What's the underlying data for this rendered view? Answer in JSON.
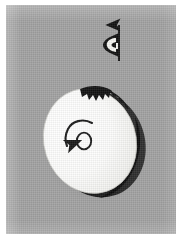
{
  "figure": {
    "title": "Spinning disc with angular velocity and vertical axis arrow",
    "caption": "",
    "plate": {
      "background_color": "#a2a2a2",
      "border_color": "#ffffff",
      "width": 170,
      "height": 229
    }
  },
  "objects": {
    "disc": {
      "name": "disc",
      "label": "",
      "fill_color": "#fbfbfa",
      "rim_color": "#161616",
      "shadow_color": "#6f6f6f",
      "center_x": 86,
      "center_y": 138,
      "radius_x": 47,
      "radius_y": 54,
      "tilt_degrees": -18,
      "notes": "white circular disc seen obliquely, dark thick rim along upper-right and lower-right edge, jagged chipped detail near top-right"
    },
    "rotation_arrow": {
      "name": "angular-velocity-arrow",
      "symbol": "ω",
      "direction": "counterclockwise",
      "color": "#1c1c1c",
      "center_x": 74,
      "center_y": 131
    },
    "axis_arrow": {
      "name": "vertical-axis-arrow",
      "direction": "up",
      "color": "#121212",
      "tip_x": 119,
      "tip_y": 17,
      "tail_x": 119,
      "tail_y": 58
    },
    "hand_glyph": {
      "name": "hand-glyph",
      "label": "",
      "fill_color": "#f4f4f0",
      "outline_color": "#141414",
      "center_x": 110,
      "center_y": 40,
      "notes": "small white hand / flag shape attached at left of the vertical arrow shaft"
    }
  },
  "annotations": {
    "omega_label": "ω",
    "rotation_sense": "counterclockwise",
    "axis_label": ""
  },
  "colors": {
    "plate_gray": "#a2a2a2",
    "disc_white": "#fbfbfa",
    "ink_black": "#161616",
    "page_white": "#ffffff"
  }
}
